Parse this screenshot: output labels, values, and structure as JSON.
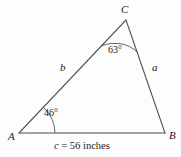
{
  "figure": {
    "type": "triangle-diagram",
    "background_color": "#fdfdfd",
    "stroke_color": "#4a4a4a",
    "text_color": "#1a1a1a",
    "vertices": {
      "A": {
        "label": "A",
        "x": 19,
        "y": 133
      },
      "B": {
        "label": "B",
        "x": 165,
        "y": 133
      },
      "C": {
        "label": "C",
        "x": 126,
        "y": 20
      }
    },
    "sides": {
      "a": {
        "label": "a",
        "from": "C",
        "to": "B"
      },
      "b": {
        "label": "b",
        "from": "A",
        "to": "C"
      },
      "c": {
        "label": "c",
        "from": "A",
        "to": "B"
      }
    },
    "angles": {
      "at_C": {
        "label": "63°",
        "value": 63,
        "vertex": "C"
      },
      "at_A": {
        "label": "46°",
        "value": 46,
        "vertex": "A"
      }
    },
    "caption": {
      "variable": "c",
      "equals": " = ",
      "value": "56 inches",
      "full": "c = 56 inches"
    }
  }
}
